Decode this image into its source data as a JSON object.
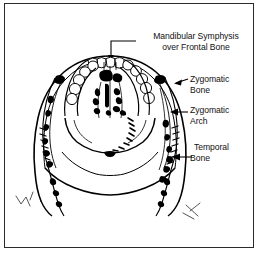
{
  "figure": {
    "kind": "anatomical-line-drawing",
    "view": "superior-anterior view of skull",
    "background_color": "#ffffff",
    "ink_color": "#000000",
    "frame_color": "#2b2b2b",
    "frame": {
      "x": 4,
      "y": 3,
      "width": 250,
      "height": 245,
      "border_width": 1
    }
  },
  "labels": [
    {
      "name": "mandibular-symphysis",
      "line1": "Mandibular Symphysis",
      "line2": "over Frontal Bone",
      "leader": "elbow-line-with-down-arrow",
      "align": "center"
    },
    {
      "name": "zygomatic-bone",
      "line1": "Zygomatic",
      "line2": "Bone",
      "leader": "short-diagonal-line",
      "align": "left"
    },
    {
      "name": "zygomatic-arch",
      "line1": "Zygomatic",
      "line2": "Arch",
      "leader": "horizontal-left-arrow",
      "align": "left"
    },
    {
      "name": "temporal-bone",
      "line1": "Temporal",
      "line2": "Bone",
      "leader": "horizontal-left-arrow",
      "align": "left"
    }
  ],
  "anatomy_parts": [
    "maxillary dental arch",
    "incisor teeth",
    "nasal cavity",
    "hard palate",
    "left zygomatic arch",
    "right zygomatic arch",
    "left temporal bone",
    "right temporal bone",
    "mandibular ramus left",
    "mandibular ramus right"
  ]
}
